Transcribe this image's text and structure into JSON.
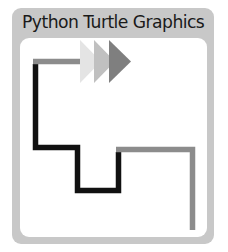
{
  "window": {
    "title": "Python Turtle Graphics"
  },
  "colors": {
    "frame": "#c8c8c8",
    "canvas": "#ffffff",
    "path_black": "#111111",
    "path_gray": "#8c8c8c",
    "arrow_light": "#e4e4e4",
    "arrow_mid": "#c0c0c0",
    "arrow_dark": "#7f7f7f"
  },
  "drawing": {
    "turtle_icon": "arrow-right",
    "arrow_count": 3
  }
}
